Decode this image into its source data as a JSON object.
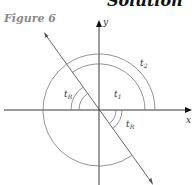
{
  "heading": "Solution",
  "figure_label": "Figure 6",
  "axes": {
    "x_label": "x",
    "y_label": "y"
  },
  "angle_labels": {
    "t1": {
      "main": "t",
      "sub": "1"
    },
    "t2": {
      "main": "t",
      "sub": "2"
    },
    "tR_upper": {
      "main": "t",
      "sub": "R"
    },
    "tR_lower": {
      "main": "t",
      "sub": "R"
    }
  },
  "colors": {
    "axis": "#222222",
    "arc": "#777777",
    "diagonal": "#555555",
    "figure_label": "#8a8a8a"
  }
}
